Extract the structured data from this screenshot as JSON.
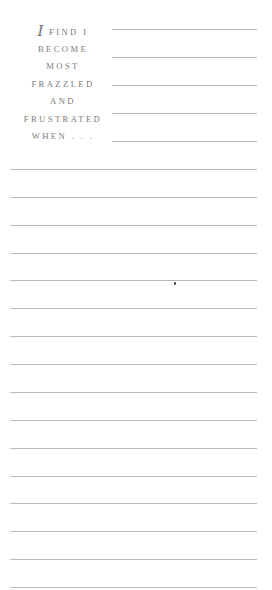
{
  "prompt": {
    "dropcap": "I",
    "lines": [
      " FIND I",
      "BECOME",
      "MOST",
      "FRAZZLED",
      "AND",
      "FRUSTRATED",
      "WHEN . . ."
    ]
  },
  "writing_area": {
    "short_lines_count": 5,
    "full_lines_count": 16,
    "line_color": "#b8b8b8",
    "text_color": "#7a7a7a"
  }
}
